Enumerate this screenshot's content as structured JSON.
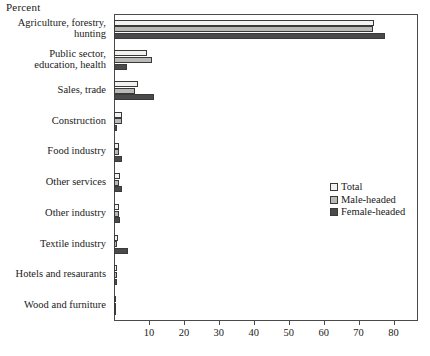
{
  "chart_data": {
    "type": "bar",
    "orientation": "horizontal",
    "title": "",
    "xlabel": "Percent",
    "ylabel": "",
    "xlim": [
      0,
      87
    ],
    "xticks": [
      10,
      20,
      30,
      40,
      50,
      60,
      70,
      80
    ],
    "grid": false,
    "legend_position": "center-right",
    "categories": [
      "Agriculture, forestry, hunting",
      "Public sector, education, health",
      "Sales, trade",
      "Construction",
      "Food industry",
      "Other services",
      "Other industry",
      "Textile industry",
      "Hotels and resaurants",
      "Wood and furniture"
    ],
    "category_lines": [
      [
        "Agriculture, forestry,",
        "hunting"
      ],
      [
        "Public sector,",
        "education, health"
      ],
      [
        "Sales, trade"
      ],
      [
        "Construction"
      ],
      [
        "Food industry"
      ],
      [
        "Other services"
      ],
      [
        "Other industry"
      ],
      [
        "Textile industry"
      ],
      [
        "Hotels and resaurants"
      ],
      [
        "Wood and furniture"
      ]
    ],
    "series": [
      {
        "name": "Total",
        "color": "#f2f2f0",
        "values": [
          74.5,
          9.5,
          7.0,
          2.3,
          1.5,
          1.6,
          1.4,
          1.1,
          0.8,
          0.7
        ]
      },
      {
        "name": "Male-headed",
        "color": "#b9b9b5",
        "values": [
          74.0,
          11.0,
          6.0,
          2.4,
          1.4,
          1.5,
          1.4,
          0.9,
          0.8,
          0.7
        ]
      },
      {
        "name": "Female-headed",
        "color": "#4a4a4a",
        "values": [
          77.5,
          3.7,
          11.4,
          1.0,
          2.3,
          2.2,
          1.8,
          4.0,
          0.9,
          0.6
        ]
      }
    ]
  },
  "legend": {
    "items": [
      {
        "label": "Total",
        "swatch": "total"
      },
      {
        "label": "Male-headed",
        "swatch": "male"
      },
      {
        "label": "Female-headed",
        "swatch": "female"
      }
    ]
  },
  "colors": {
    "total": "#f2f2f0",
    "male": "#b9b9b5",
    "female": "#4a4a4a",
    "axis": "#4a4a4a",
    "text": "#1a1a1a",
    "background": "#ffffff"
  }
}
